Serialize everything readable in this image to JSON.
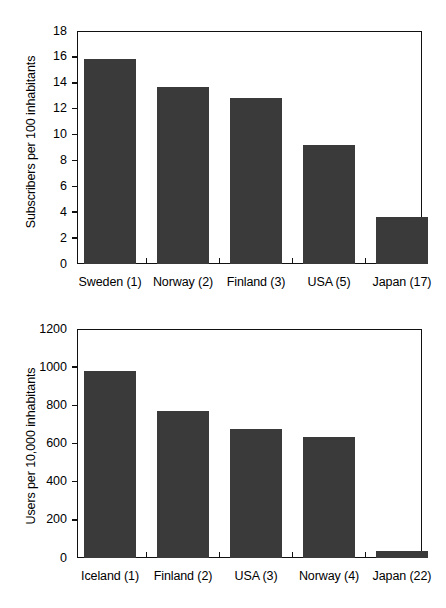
{
  "chart_data": [
    {
      "type": "bar",
      "title": "",
      "xlabel": "",
      "ylabel": "Subscribers per 100 inhabitants",
      "ylim": [
        0,
        18
      ],
      "ytick_labels": [
        "18",
        "16",
        "14",
        "12",
        "10",
        "8",
        "6",
        "4",
        "2",
        "0"
      ],
      "ytick_values": [
        18,
        16,
        14,
        12,
        10,
        8,
        6,
        4,
        2,
        0
      ],
      "grid": false,
      "legend": "none",
      "categories": [
        "Sweden (1)",
        "Norway (2)",
        "Finland (3)",
        "USA  (5)",
        "Japan (17)"
      ],
      "values": [
        15.8,
        13.7,
        12.8,
        9.2,
        3.6
      ],
      "bar_color": "#3a3a3a"
    },
    {
      "type": "bar",
      "title": "",
      "xlabel": "",
      "ylabel": "Users per 10,000 inhabitants",
      "ylim": [
        0,
        1200
      ],
      "ytick_labels": [
        "1200",
        "1000",
        "800",
        "600",
        "400",
        "200",
        "0"
      ],
      "ytick_values": [
        1200,
        1000,
        800,
        600,
        400,
        200,
        0
      ],
      "grid": false,
      "legend": "none",
      "categories": [
        "Iceland (1)",
        "Finland (2)",
        "USA  (3)",
        "Norway (4)",
        "Japan (22)"
      ],
      "values": [
        980,
        770,
        676,
        634,
        37
      ],
      "bar_color": "#3a3a3a"
    }
  ],
  "charts": {
    "top": {
      "y_title": "Subscribers per 100 inhabitants",
      "y_ticks": [
        "18",
        "16",
        "14",
        "12",
        "10",
        "8",
        "6",
        "4",
        "2",
        "0"
      ],
      "x_labels": [
        "Sweden (1)",
        "Norway (2)",
        "Finland (3)",
        "USA  (5)",
        "Japan (17)"
      ]
    },
    "bottom": {
      "y_title": "Users per 10,000 inhabitants",
      "y_ticks": [
        "1200",
        "1000",
        "800",
        "600",
        "400",
        "200",
        "0"
      ],
      "x_labels": [
        "Iceland (1)",
        "Finland (2)",
        "USA  (3)",
        "Norway (4)",
        "Japan (22)"
      ]
    }
  }
}
